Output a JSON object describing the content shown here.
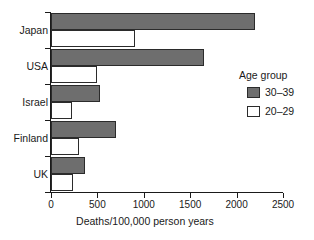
{
  "chart_data": {
    "type": "bar",
    "orientation": "horizontal",
    "title": "",
    "xlabel": "Deaths/100,000 person years",
    "ylabel": "",
    "categories": [
      "Japan",
      "USA",
      "Israel",
      "Finland",
      "UK"
    ],
    "series": [
      {
        "name": "30–39",
        "values": [
          2200,
          1650,
          530,
          700,
          370
        ],
        "color": "#6e6e6e"
      },
      {
        "name": "20–29",
        "values": [
          900,
          500,
          225,
          300,
          235
        ],
        "color": "#ffffff"
      }
    ],
    "xlim": [
      0,
      2500
    ],
    "xticks": [
      0,
      500,
      1000,
      1500,
      2000,
      2500
    ],
    "xtick_labels": [
      "0",
      "500",
      "1000",
      "1500",
      "2000",
      "2500"
    ],
    "grid": false,
    "legend": {
      "title": "Age group",
      "position": "right",
      "entries": [
        {
          "label": "30–39",
          "swatch": "dark"
        },
        {
          "label": "20–29",
          "swatch": "light"
        }
      ]
    }
  },
  "colors": {
    "bar_dark": "#6e6e6e",
    "bar_light": "#ffffff",
    "outline": "#2b2b2b",
    "text": "#1a1a1a",
    "background": "#ffffff"
  }
}
